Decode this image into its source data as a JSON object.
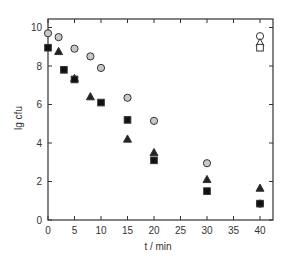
{
  "chart_data": {
    "type": "scatter",
    "title": "",
    "xlabel": "t / min",
    "ylabel": "lg cfu",
    "xlim": [
      0,
      42.5
    ],
    "ylim": [
      0,
      10.4
    ],
    "x_ticks": [
      0,
      5,
      10,
      15,
      20,
      25,
      30,
      35,
      40
    ],
    "y_ticks": [
      0,
      2,
      4,
      6,
      8,
      10
    ],
    "grid": false,
    "legend": null,
    "series": [
      {
        "name": "circle (grey)",
        "marker": "circle",
        "fill": "#c8c8c8",
        "points": [
          [
            0,
            9.7
          ],
          [
            2,
            9.5
          ],
          [
            5,
            8.9
          ],
          [
            8,
            8.5
          ],
          [
            10,
            7.9
          ],
          [
            15,
            6.35
          ],
          [
            20,
            5.15
          ],
          [
            30,
            2.95
          ],
          [
            40,
            0.85
          ]
        ]
      },
      {
        "name": "triangle (filled)",
        "marker": "triangle",
        "fill": "#222222",
        "points": [
          [
            2,
            8.75
          ],
          [
            5,
            7.35
          ],
          [
            8,
            6.4
          ],
          [
            15,
            4.2
          ],
          [
            20,
            3.5
          ],
          [
            30,
            2.1
          ],
          [
            40,
            1.65
          ]
        ]
      },
      {
        "name": "square (filled)",
        "marker": "square",
        "fill": "#111111",
        "points": [
          [
            0,
            8.95
          ],
          [
            3,
            7.8
          ],
          [
            5,
            7.3
          ],
          [
            10,
            6.1
          ],
          [
            15,
            5.2
          ],
          [
            20,
            3.1
          ],
          [
            30,
            1.5
          ],
          [
            40,
            0.85
          ]
        ]
      },
      {
        "name": "control circle (open)",
        "marker": "circle",
        "fill": "#ffffff",
        "points": [
          [
            40,
            9.55
          ]
        ]
      },
      {
        "name": "control triangle (open)",
        "marker": "triangle",
        "fill": "#ffffff",
        "points": [
          [
            40,
            9.2
          ]
        ]
      },
      {
        "name": "control square (open)",
        "marker": "square",
        "fill": "#ffffff",
        "points": [
          [
            40,
            8.95
          ]
        ]
      }
    ]
  },
  "layout": {
    "plot_left": 48,
    "plot_right": 273,
    "plot_top": 19,
    "plot_bottom": 220,
    "px_per_x": 5.3,
    "px_per_y": 19.25
  }
}
